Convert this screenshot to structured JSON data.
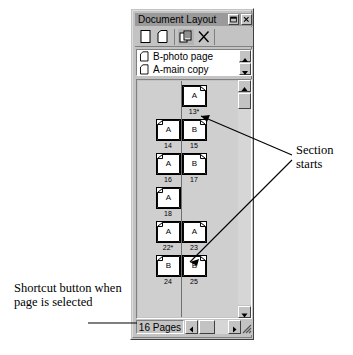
{
  "window": {
    "title": "Document Layout",
    "buttons": [
      {
        "name": "minimize",
        "glyph": "minimize-icon"
      },
      {
        "name": "close",
        "glyph": "close-icon"
      }
    ]
  },
  "toolbar": {
    "items": [
      {
        "name": "new-page",
        "icon": "blank-page-icon",
        "label": ""
      },
      {
        "name": "insert-page",
        "icon": "folded-page-icon",
        "label": ""
      },
      {
        "name": "duplicate-page",
        "icon": "duplicate-pages-icon",
        "label": ""
      },
      {
        "name": "delete-page",
        "icon": "delete-x-icon",
        "label": ""
      }
    ]
  },
  "master_pages": {
    "items": [
      {
        "label": "B-photo page",
        "icon": "master-page-icon"
      },
      {
        "label": "A-main copy",
        "icon": "master-page-icon"
      }
    ],
    "scroll": {
      "up": "scroll-up-icon",
      "down": "scroll-down-icon"
    }
  },
  "pages": {
    "rows": [
      {
        "left": null,
        "right": {
          "master": "A",
          "number": "13*"
        }
      },
      {
        "left": {
          "master": "A",
          "number": "14"
        },
        "right": {
          "master": "B",
          "number": "15"
        }
      },
      {
        "left": {
          "master": "A",
          "number": "16"
        },
        "right": {
          "master": "B",
          "number": "17"
        }
      },
      {
        "left": {
          "master": "A",
          "number": "18"
        },
        "right": null
      },
      {
        "left": {
          "master": "A",
          "number": "22*"
        },
        "right": {
          "master": "A",
          "number": "23"
        }
      },
      {
        "left": {
          "master": "B",
          "number": "24"
        },
        "right": {
          "master": "B",
          "number": "25"
        }
      }
    ],
    "scroll": {
      "up": "scroll-up-icon",
      "down": "scroll-down-icon"
    }
  },
  "statusbar": {
    "page_count": "16 Pages",
    "hscroll": {
      "left": "scroll-left-icon",
      "right": "scroll-right-icon"
    },
    "grip": "resize-grip-icon"
  },
  "annotations": {
    "section_starts": "Section starts",
    "shortcut_button": "Shortcut button when page is selected"
  }
}
